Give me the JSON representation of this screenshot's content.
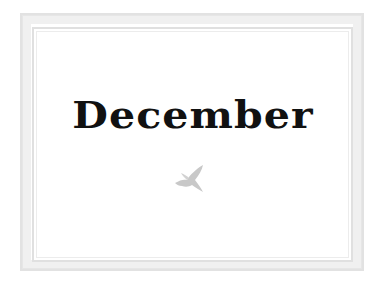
{
  "card": {
    "title": "December",
    "icon": "bird-icon",
    "frame_color": "#e0e0e0",
    "text_color": "#111111",
    "icon_color": "#c8c8c8"
  }
}
